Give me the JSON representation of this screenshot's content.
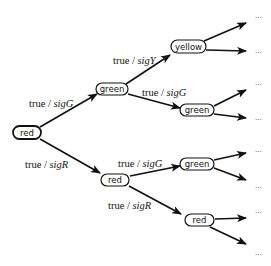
{
  "diagram": {
    "type": "state-tree",
    "nodes": {
      "root": {
        "label": "red"
      },
      "l1_top": {
        "label": "green"
      },
      "l1_bottom": {
        "label": "red"
      },
      "l2_a": {
        "label": "yellow"
      },
      "l2_b": {
        "label": "green"
      },
      "l2_c": {
        "label": "green"
      },
      "l2_d": {
        "label": "red"
      }
    },
    "edges": {
      "root_to_l1_top": {
        "guard": "true",
        "sep": " / ",
        "action": "sigG"
      },
      "root_to_l1_bottom": {
        "guard": "true",
        "sep": " / ",
        "action": "sigR"
      },
      "l1_top_to_l2_a": {
        "guard": "true",
        "sep": " / ",
        "action": "sigY"
      },
      "l1_top_to_l2_b": {
        "guard": "true",
        "sep": " / ",
        "action": "sigG"
      },
      "l1_bottom_to_l2_c": {
        "guard": "true",
        "sep": " / ",
        "action": "sigG"
      },
      "l1_bottom_to_l2_d": {
        "guard": "true",
        "sep": " / ",
        "action": "sigR"
      }
    },
    "continuation": "..."
  }
}
